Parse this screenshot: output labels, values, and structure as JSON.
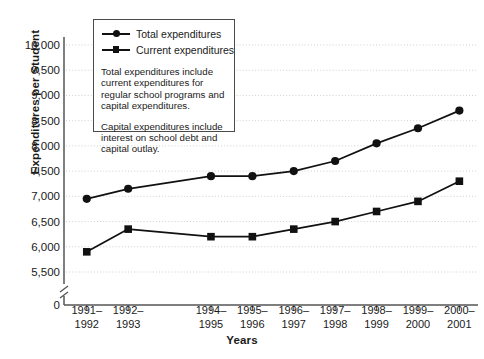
{
  "chart_data": {
    "type": "line",
    "title": "",
    "xlabel": "Years",
    "ylabel": "Expenditures per Student",
    "categories": [
      "1991–\n1992",
      "1992–\n1993",
      "1994–\n1995",
      "1995–\n1996",
      "1996–\n1997",
      "1997–\n1998",
      "1998–\n1999",
      "1999–\n2000",
      "2000–\n2001"
    ],
    "category_slots": [
      0,
      1,
      3,
      4,
      5,
      6,
      7,
      8,
      9
    ],
    "slot_count": 10,
    "series": [
      {
        "name": "Total expenditures",
        "marker": "circle",
        "values": [
          6950,
          7150,
          7400,
          7400,
          7500,
          7700,
          8050,
          8350,
          8700
        ]
      },
      {
        "name": "Current expenditures",
        "marker": "square",
        "values": [
          5900,
          6350,
          6200,
          6200,
          6350,
          6500,
          6700,
          6900,
          7300
        ]
      }
    ],
    "yticks": [
      {
        "label": "10,000",
        "value": 10000
      },
      {
        "label": "9,500",
        "value": 9500
      },
      {
        "label": "9,000",
        "value": 9000
      },
      {
        "label": "8,500",
        "value": 8500
      },
      {
        "label": "8,000",
        "value": 8000
      },
      {
        "label": "7,500",
        "value": 7500
      },
      {
        "label": "7,000",
        "value": 7000
      },
      {
        "label": "6,500",
        "value": 6500
      },
      {
        "label": "6,000",
        "value": 6000
      },
      {
        "label": "5,500",
        "value": 5500
      },
      {
        "label": "0",
        "value": 0
      }
    ],
    "ylim": [
      5500,
      10000
    ],
    "axis_break": true,
    "grid": true,
    "legend_position": "upper-left-inside"
  },
  "legend": {
    "entries": [
      {
        "label": "Total expenditures",
        "marker": "circle"
      },
      {
        "label": "Current expenditures",
        "marker": "square"
      }
    ],
    "notes": [
      "Total expenditures include current expenditures for regular school programs and capital expenditures.",
      "Capital expenditures include interest on school debt and capital outlay."
    ]
  },
  "colors": {
    "line": "#111111",
    "marker": "#111111",
    "axis": "#555555",
    "grid": "#c9c9c9",
    "text": "#1a1a1a",
    "background": "#ffffff"
  }
}
